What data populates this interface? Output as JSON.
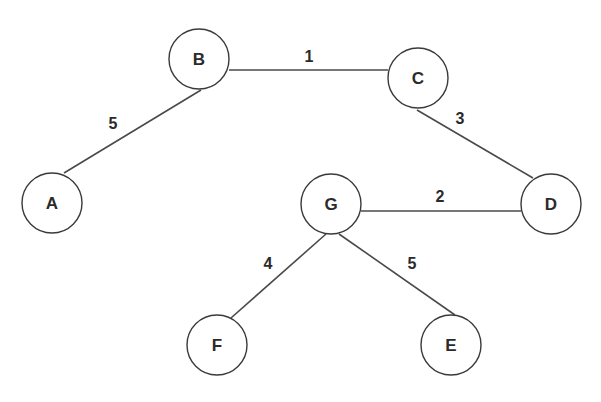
{
  "graph": {
    "type": "weighted-undirected",
    "nodes": [
      {
        "id": "A",
        "label": "A",
        "x": 52,
        "y": 203
      },
      {
        "id": "B",
        "label": "B",
        "x": 199,
        "y": 59
      },
      {
        "id": "C",
        "label": "C",
        "x": 418,
        "y": 78
      },
      {
        "id": "D",
        "label": "D",
        "x": 551,
        "y": 204
      },
      {
        "id": "G",
        "label": "G",
        "x": 331,
        "y": 204
      },
      {
        "id": "F",
        "label": "F",
        "x": 217,
        "y": 345
      },
      {
        "id": "E",
        "label": "E",
        "x": 451,
        "y": 345
      }
    ],
    "edges": [
      {
        "from": "B",
        "to": "A",
        "weight": "5",
        "x1": 201,
        "y1": 90,
        "x2": 64,
        "y2": 173,
        "lx": 113,
        "ly": 123
      },
      {
        "from": "B",
        "to": "C",
        "weight": "1",
        "x1": 229,
        "y1": 70,
        "x2": 388,
        "y2": 70,
        "lx": 309,
        "ly": 56
      },
      {
        "from": "C",
        "to": "D",
        "weight": "3",
        "x1": 417,
        "y1": 110,
        "x2": 533,
        "y2": 178,
        "lx": 460,
        "ly": 118
      },
      {
        "from": "G",
        "to": "D",
        "weight": "2",
        "x1": 361,
        "y1": 211,
        "x2": 521,
        "y2": 211,
        "lx": 440,
        "ly": 196
      },
      {
        "from": "G",
        "to": "F",
        "weight": "4",
        "x1": 326,
        "y1": 234,
        "x2": 231,
        "y2": 318,
        "lx": 268,
        "ly": 263
      },
      {
        "from": "G",
        "to": "E",
        "weight": "5",
        "x1": 339,
        "y1": 234,
        "x2": 455,
        "y2": 315,
        "lx": 412,
        "ly": 263
      }
    ]
  },
  "style": {
    "node_radius": 30,
    "edge_color": "#4a4a4a",
    "node_stroke": "#3a3a3a",
    "background": "#ffffff"
  }
}
